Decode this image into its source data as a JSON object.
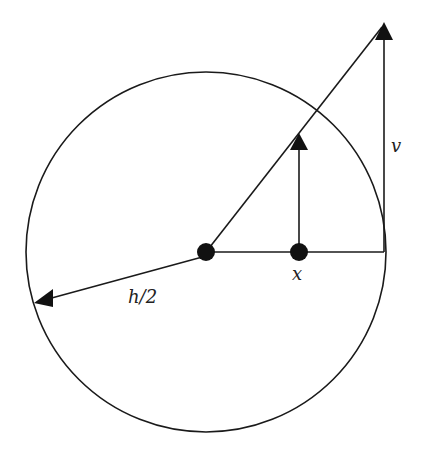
{
  "diagram": {
    "type": "geometric-figure",
    "colors": {
      "stroke": "#1a1a1a",
      "fill": "#111111",
      "background": "#ffffff"
    },
    "circle": {
      "cx": 206,
      "cy": 252,
      "r": 180
    },
    "center_point": {
      "x": 206,
      "y": 252
    },
    "x_point": {
      "x": 299,
      "y": 252
    },
    "labels": {
      "radius": "h/2",
      "velocity": "v",
      "position": "x"
    }
  }
}
